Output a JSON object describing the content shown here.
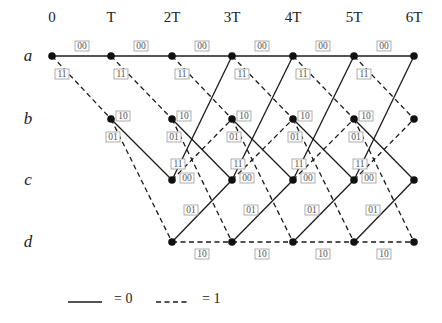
{
  "diagram": {
    "title": "",
    "time_labels": [
      "0",
      "T",
      "2T",
      "3T",
      "4T",
      "5T",
      "6T"
    ],
    "state_labels": [
      "a",
      "b",
      "c",
      "d"
    ],
    "layout": {
      "columns_x": [
        52,
        111,
        172,
        232,
        293,
        354,
        414
      ],
      "rows_y": {
        "a": 56,
        "b": 119,
        "c": 180,
        "d": 242
      },
      "time_label_y": 22,
      "state_label_x": 28
    },
    "transitions": [
      {
        "from": "a",
        "to": "a",
        "style": "solid",
        "output": "00"
      },
      {
        "from": "a",
        "to": "b",
        "style": "dashed",
        "output": "11"
      },
      {
        "from": "b",
        "to": "c",
        "style": "solid",
        "output": "10"
      },
      {
        "from": "b",
        "to": "d",
        "style": "dashed",
        "output": "01"
      },
      {
        "from": "c",
        "to": "a",
        "style": "solid",
        "output": "11"
      },
      {
        "from": "c",
        "to": "b",
        "style": "dashed",
        "output": "00"
      },
      {
        "from": "d",
        "to": "c",
        "style": "solid",
        "output": "01"
      },
      {
        "from": "d",
        "to": "d",
        "style": "dashed",
        "output": "10"
      }
    ],
    "reachable_states_by_time": [
      [
        "a"
      ],
      [
        "a",
        "b"
      ],
      [
        "a",
        "b",
        "c",
        "d"
      ],
      [
        "a",
        "b",
        "c",
        "d"
      ],
      [
        "a",
        "b",
        "c",
        "d"
      ],
      [
        "a",
        "b",
        "c",
        "d"
      ],
      [
        "a",
        "b",
        "c",
        "d"
      ]
    ],
    "legend": {
      "solid_label": "= 0",
      "dashed_label": "= 1"
    },
    "colors": {
      "line": "#1a1a1a",
      "label_box_border": "#9a9a9a",
      "label_text": "#555555"
    }
  }
}
